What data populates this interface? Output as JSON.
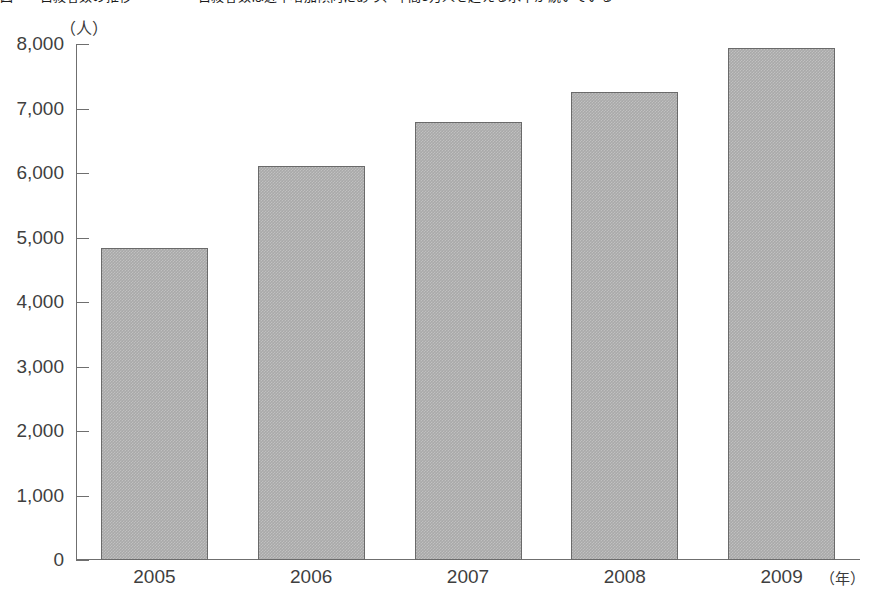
{
  "figure": {
    "title_clipped": "図　　自殺者数の推移　　　　　自殺者数は近年増加傾向にあり、年間3万人を超える水準が続いている",
    "title_note": "title row is cut off at the top edge of the screenshot and is not legible"
  },
  "chart_data": {
    "type": "bar",
    "title": "",
    "xlabel": "（年）",
    "ylabel": "（人）",
    "categories": [
      "2005",
      "2006",
      "2007",
      "2008",
      "2009"
    ],
    "values": [
      4840,
      6110,
      6790,
      7260,
      7940
    ],
    "ylim": [
      0,
      8000
    ],
    "ytick_step": 1000,
    "ytick_labels": [
      "0",
      "1,000",
      "2,000",
      "3,000",
      "4,000",
      "5,000",
      "6,000",
      "7,000",
      "8,000"
    ],
    "ytick_values": [
      0,
      1000,
      2000,
      3000,
      4000,
      5000,
      6000,
      7000,
      8000
    ],
    "grid": false,
    "legend": null,
    "series": [
      {
        "name": "人数",
        "values": [
          4840,
          6110,
          6790,
          7260,
          7940
        ]
      }
    ],
    "bar_color": "#a9a9a9",
    "bar_edge_color": "#6a6a6a",
    "axis_color": "#6f6f6f",
    "text_color": "#3f3f3f"
  }
}
